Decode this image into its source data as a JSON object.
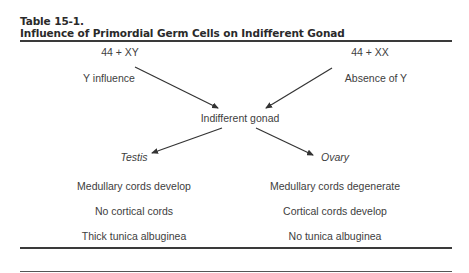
{
  "table": {
    "label": "Table 15-1.",
    "title": "Influence of Primordial Germ Cells on Indifferent Gonad"
  },
  "diagram": {
    "left_karyotype": "44 + XY",
    "right_karyotype": "44 + XX",
    "left_influence": "Y influence",
    "right_influence": "Absence of Y",
    "center_node": "Indifferent gonad",
    "left_outcome": "Testis",
    "right_outcome": "Ovary",
    "left_features": [
      "Medullary cords develop",
      "No cortical cords",
      "Thick tunica albuginea"
    ],
    "right_features": [
      "Medullary cords degenerate",
      "Cortical cords develop",
      "No tunica albuginea"
    ]
  },
  "colors": {
    "text": "#404040",
    "rule": "#3a3a3a",
    "arrow": "#333333"
  }
}
